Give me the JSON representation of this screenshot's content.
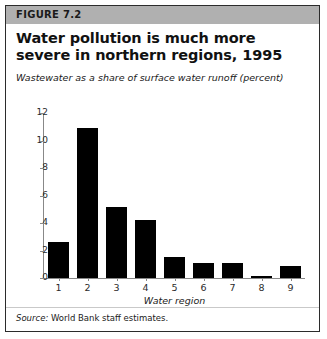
{
  "figure": {
    "header_label": "FIGURE 7.2",
    "title": "Water pollution is much more severe in northern regions, 1995",
    "subtitle": "Wastewater as a share of surface water runoff (percent)",
    "source": {
      "label": "Source:",
      "text": "World Bank staff estimates."
    },
    "colors": {
      "header_band": "#b0b0b0",
      "bar": "#000000",
      "axis": "#888888",
      "border": "#2b2b2b",
      "background": "#ffffff"
    }
  },
  "chart_data": {
    "type": "bar",
    "title": "Water pollution is much more severe in northern regions, 1995",
    "subtitle": "Wastewater as a share of surface water runoff (percent)",
    "xlabel": "Water region",
    "ylabel": "",
    "categories": [
      "1",
      "2",
      "3",
      "4",
      "5",
      "6",
      "7",
      "8",
      "9"
    ],
    "values": [
      2.6,
      10.9,
      5.2,
      4.2,
      1.5,
      1.1,
      1.1,
      0.15,
      0.85
    ],
    "ylim": [
      0,
      12
    ],
    "yticks": [
      0,
      2,
      4,
      6,
      8,
      10,
      12
    ],
    "ytick_labels": [
      "0",
      "2",
      "4",
      "6",
      "8",
      "10",
      "12"
    ],
    "grid": false,
    "legend": false
  }
}
